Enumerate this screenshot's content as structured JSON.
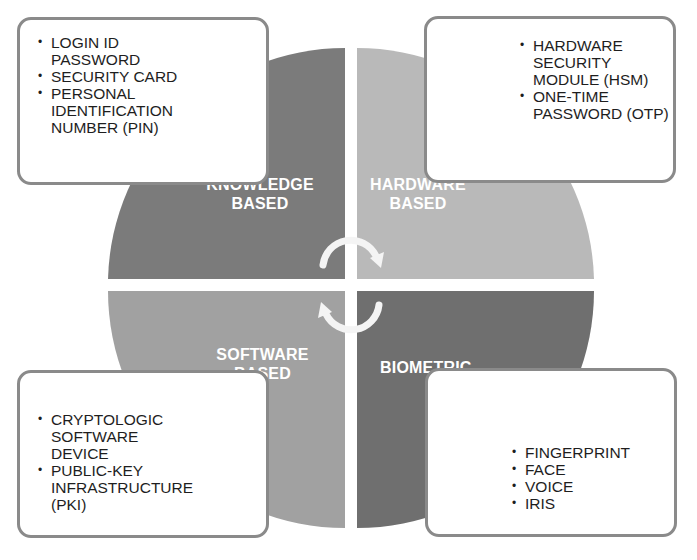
{
  "diagram": {
    "type": "four-quadrant-cycle",
    "quadrants": [
      {
        "id": "knowledge",
        "position": "top-left",
        "label": "KNOWLEDGE BASED",
        "color": "#7b7b7b",
        "items": [
          "LOGIN ID PASSWORD",
          "SECURITY CARD",
          "PERSONAL IDENTIFICATION NUMBER (PIN)"
        ]
      },
      {
        "id": "hardware",
        "position": "top-right",
        "label": "HARDWARE BASED",
        "color": "#b8b8b8",
        "items": [
          "HARDWARE SECURITY MODULE (HSM)",
          "ONE-TIME PASSWORD (OTP)"
        ]
      },
      {
        "id": "software",
        "position": "bottom-left",
        "label": "SOFTWARE BASED",
        "color": "#a0a0a0",
        "items": [
          "CRYPTOLOGIC SOFTWARE DEVICE",
          "PUBLIC-KEY INFRASTRUCTURE (PKI)"
        ]
      },
      {
        "id": "biometric",
        "position": "bottom-right",
        "label": "BIOMETRIC",
        "color": "#6e6e6e",
        "items": [
          "FINGERPRINT",
          "FACE",
          "VOICE",
          "IRIS"
        ]
      }
    ],
    "center_icon": "cycle-arrows-icon",
    "box_border_color": "#8a8a8a"
  }
}
